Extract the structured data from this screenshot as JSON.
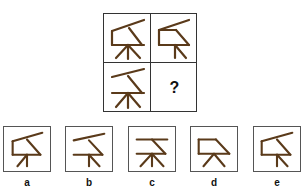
{
  "puzzle": {
    "grid": {
      "rows": 2,
      "cols": 2,
      "cells": [
        {
          "id": "r1c1",
          "figure": "full-figure"
        },
        {
          "id": "r1c2",
          "figure": "box-slant-partial-legs"
        },
        {
          "id": "r2c1",
          "figure": "lines-slant-legs"
        },
        {
          "id": "r2c2",
          "figure": "unknown",
          "text": "?"
        }
      ]
    },
    "options": [
      {
        "label": "a"
      },
      {
        "label": "b"
      },
      {
        "label": "c"
      },
      {
        "label": "d"
      },
      {
        "label": "e"
      }
    ],
    "colors": {
      "stroke": "#5a3a1a",
      "border": "#333333"
    }
  }
}
